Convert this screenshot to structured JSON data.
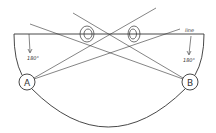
{
  "diagram": {
    "type": "geometry-sightline",
    "nodes": [
      {
        "id": "A",
        "label": "A",
        "cx": 27,
        "cy": 82,
        "r": 8
      },
      {
        "id": "B",
        "label": "B",
        "cx": 190,
        "cy": 82,
        "r": 8
      }
    ],
    "labels": {
      "left_angle": "180°",
      "right_angle": "180°",
      "line": "line"
    },
    "eyes": [
      {
        "name": "left-eye",
        "cx": 87,
        "cy": 34
      },
      {
        "name": "right-eye",
        "cx": 134,
        "cy": 34
      }
    ],
    "colors": {
      "stroke": "#333333",
      "background": "#ffffff"
    }
  }
}
